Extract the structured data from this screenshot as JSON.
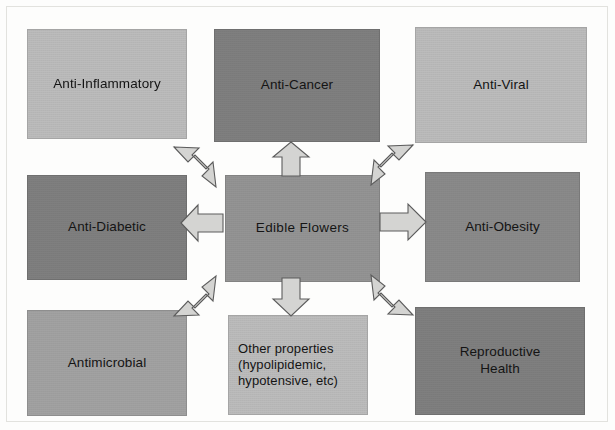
{
  "diagram": {
    "type": "radial-concept-map",
    "center": {
      "id": "edible-flowers",
      "label": "Edible Flowers",
      "tone": "tone-mid"
    },
    "nodes": [
      {
        "id": "anti-inflammatory",
        "label": "Anti-Inflammatory",
        "tone": "tone-light",
        "position": "top-left"
      },
      {
        "id": "anti-cancer",
        "label": "Anti-Cancer",
        "tone": "tone-darker",
        "position": "top-center"
      },
      {
        "id": "anti-viral",
        "label": "Anti-Viral",
        "tone": "tone-light",
        "position": "top-right"
      },
      {
        "id": "anti-diabetic",
        "label": "Anti-Diabetic",
        "tone": "tone-darker",
        "position": "middle-left"
      },
      {
        "id": "anti-obesity",
        "label": "Anti-Obesity",
        "tone": "tone-dark",
        "position": "middle-right"
      },
      {
        "id": "antimicrobial",
        "label": "Antimicrobial",
        "tone": "tone-medium",
        "position": "bottom-left"
      },
      {
        "id": "other-properties",
        "label": "Other properties (hypolipidemic, hypotensive, etc)",
        "tone": "tone-light",
        "position": "bottom-center"
      },
      {
        "id": "reproductive-health",
        "label": "Reproductive Health",
        "tone": "tone-darker",
        "position": "bottom-right"
      }
    ],
    "arrows": [
      {
        "id": "arrow-up-left",
        "direction": "up-left",
        "from": "edible-flowers",
        "to": "anti-inflammatory"
      },
      {
        "id": "arrow-up",
        "direction": "up",
        "from": "edible-flowers",
        "to": "anti-cancer"
      },
      {
        "id": "arrow-up-right",
        "direction": "up-right",
        "from": "edible-flowers",
        "to": "anti-viral"
      },
      {
        "id": "arrow-left",
        "direction": "left",
        "from": "edible-flowers",
        "to": "anti-diabetic"
      },
      {
        "id": "arrow-right",
        "direction": "right",
        "from": "edible-flowers",
        "to": "anti-obesity"
      },
      {
        "id": "arrow-down-left",
        "direction": "down-left",
        "from": "edible-flowers",
        "to": "antimicrobial"
      },
      {
        "id": "arrow-down",
        "direction": "down",
        "from": "edible-flowers",
        "to": "other-properties"
      },
      {
        "id": "arrow-down-right",
        "direction": "down-right",
        "from": "edible-flowers",
        "to": "reproductive-health"
      }
    ]
  },
  "labels": {
    "anti_inflammatory": "Anti-Inflammatory",
    "anti_cancer": "Anti-Cancer",
    "anti_viral": "Anti-Viral",
    "anti_diabetic": "Anti-Diabetic",
    "edible_flowers": "Edible Flowers",
    "anti_obesity": "Anti-Obesity",
    "antimicrobial": "Antimicrobial",
    "other_properties_line1": "Other properties",
    "other_properties_line2": "(hypolipidemic,",
    "other_properties_line3": "hypotensive, etc)",
    "reproductive_line1": "Reproductive",
    "reproductive_line2": "Health"
  },
  "colors": {
    "page_background": "#fdfdfc",
    "tone_light": "#bcbcbc",
    "tone_medium": "#a2a2a2",
    "tone_mid": "#949494",
    "tone_dark": "#8a8a8a",
    "tone_darker": "#7f7f7f",
    "arrow_fill": "#d4d4d2",
    "arrow_stroke": "#5c5c5c",
    "text": "#141414"
  }
}
